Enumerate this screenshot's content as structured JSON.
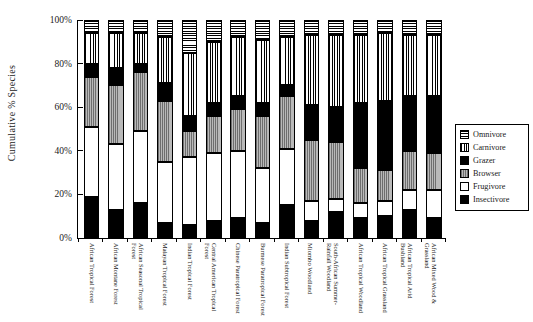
{
  "chart_data": {
    "type": "bar",
    "subtype": "stacked-bar-100-percent",
    "title": "",
    "xlabel": "",
    "ylabel": "Cumulative % Species",
    "ylim": [
      0,
      100
    ],
    "ytick_labels": [
      "0%",
      "20%",
      "40%",
      "60%",
      "80%",
      "100%"
    ],
    "ytick_values": [
      0,
      20,
      40,
      60,
      80,
      100
    ],
    "grid": false,
    "legend_position": "right",
    "stack_order_bottom_to_top": [
      "Insectivore",
      "Frugivore",
      "Browser",
      "Grazer",
      "Carnivore",
      "Omnivore"
    ],
    "categories": [
      "African Tropical Forest",
      "African Montane Forest",
      "African Seasonal Tropical Forest",
      "Malayan Tropical Forest",
      "Indian Tropical Forest",
      "Central American Tropical Forest",
      "Chinese Paratropical Forest",
      "Burmese Paratropical Forest",
      "Indian Subtropical Forest",
      "Miombo Woodland",
      "South-African Summer-Rainfall Woodland",
      "African Tropical Woodland",
      "African Tropical Grassland",
      "African Tropical Arid Bushland",
      "African Mixed Wood & Grassland"
    ],
    "series": [
      {
        "name": "Insectivore",
        "pattern": "solid-black",
        "color": "#000000",
        "values": [
          19,
          13,
          16,
          7,
          6,
          8,
          9,
          7,
          15,
          8,
          12,
          9,
          10,
          13,
          9
        ]
      },
      {
        "name": "Frugivore",
        "pattern": "solid-white",
        "color": "#ffffff",
        "values": [
          32,
          30,
          33,
          28,
          31,
          31,
          31,
          25,
          26,
          9,
          6,
          7,
          7,
          9,
          13
        ]
      },
      {
        "name": "Browser",
        "pattern": "vertical-gray-hatch",
        "color": "#9a9a9a",
        "values": [
          23,
          27,
          27,
          28,
          12,
          17,
          19,
          24,
          24,
          28,
          26,
          16,
          14,
          18,
          17
        ]
      },
      {
        "name": "Grazer",
        "pattern": "solid-black",
        "color": "#000000",
        "values": [
          6,
          8,
          4,
          8,
          7,
          6,
          6,
          6,
          5,
          16,
          16,
          30,
          32,
          25,
          26
        ]
      },
      {
        "name": "Carnivore",
        "pattern": "vertical-lines",
        "color": "#ffffff",
        "values": [
          14,
          16,
          14,
          21,
          29,
          28,
          27,
          29,
          22,
          32,
          33,
          31,
          31,
          28,
          28
        ]
      },
      {
        "name": "Omnivore",
        "pattern": "horizontal-lines",
        "color": "#ffffff",
        "values": [
          6,
          6,
          6,
          8,
          15,
          10,
          8,
          9,
          8,
          7,
          7,
          7,
          6,
          7,
          7
        ]
      }
    ]
  },
  "legend": {
    "items": [
      {
        "label": "Omnivore",
        "pattern": "horizontal-lines"
      },
      {
        "label": "Carnivore",
        "pattern": "vertical-lines"
      },
      {
        "label": "Grazer",
        "pattern": "solid-black"
      },
      {
        "label": "Browser",
        "pattern": "vertical-gray-hatch"
      },
      {
        "label": "Frugivore",
        "pattern": "solid-white"
      },
      {
        "label": "Insectivore",
        "pattern": "solid-black"
      }
    ]
  }
}
